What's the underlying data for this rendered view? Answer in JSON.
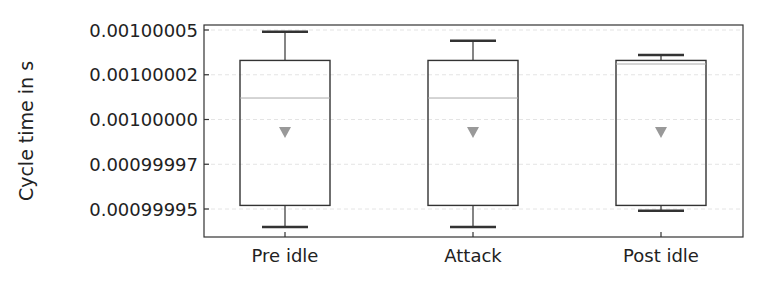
{
  "chart_data": {
    "type": "box",
    "title": "",
    "xlabel": "",
    "ylabel": "Cycle time in s",
    "categories": [
      "Pre idle",
      "Attack",
      "Post idle"
    ],
    "yticks": [
      0.00099995,
      0.000999975,
      0.001,
      0.001000025,
      0.00100005
    ],
    "ytick_labels": [
      "0.00099995",
      "0.00099997",
      "0.00100000",
      "0.00100002",
      "0.00100005"
    ],
    "ylim": [
      0.00099993,
      0.00100006
    ],
    "grid": true,
    "series": [
      {
        "name": "Pre idle",
        "whisker_low": 0.00099994,
        "q1": 0.000999952,
        "median": 0.001000012,
        "q3": 0.001000033,
        "whisker_high": 0.001000049,
        "mean": 0.000999993
      },
      {
        "name": "Attack",
        "whisker_low": 0.00099994,
        "q1": 0.000999952,
        "median": 0.001000012,
        "q3": 0.001000033,
        "whisker_high": 0.001000044,
        "mean": 0.000999993
      },
      {
        "name": "Post idle",
        "whisker_low": 0.000999949,
        "q1": 0.000999952,
        "median": 0.001000031,
        "q3": 0.001000033,
        "whisker_high": 0.001000036,
        "mean": 0.000999993
      }
    ]
  }
}
